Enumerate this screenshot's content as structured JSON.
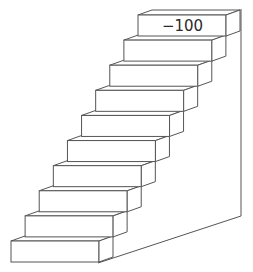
{
  "diagram": {
    "type": "staircase",
    "step_count": 10,
    "top_step_label": "−100",
    "line_color": "#555555",
    "background": "#ffffff"
  }
}
